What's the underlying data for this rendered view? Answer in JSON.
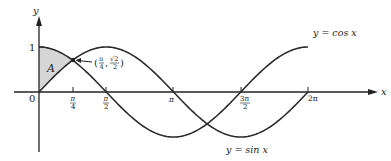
{
  "chart_data": {
    "type": "line",
    "title": "",
    "xlabel": "x",
    "ylabel": "y",
    "xlim": [
      0,
      6.2832
    ],
    "ylim": [
      -1,
      1
    ],
    "grid": false,
    "legend": "inline labels",
    "x_ticks": [
      "π/4",
      "π/2",
      "π",
      "3π/2",
      "2π"
    ],
    "x_tick_values": [
      0.7854,
      1.5708,
      3.1416,
      4.7124,
      6.2832
    ],
    "y_ticks": [
      "1"
    ],
    "origin_label": "0",
    "series": [
      {
        "name": "y = cos x",
        "function": "cos",
        "x_range": [
          0,
          6.2832
        ]
      },
      {
        "name": "y = sin x",
        "function": "sin",
        "x_range": [
          0,
          6.2832
        ]
      }
    ],
    "shaded_region": {
      "label": "A",
      "description": "Region between y = cos x (top) and y = sin x (bottom) for 0 ≤ x ≤ π/4",
      "x_range": [
        0,
        0.7854
      ],
      "color": "#d6d6d6"
    },
    "annotations": [
      {
        "text": "(π/4, √2/2)",
        "point": [
          0.7854,
          0.7071
        ],
        "arrow": true
      }
    ]
  },
  "labels": {
    "y_axis": "y",
    "x_axis": "x",
    "one": "1",
    "origin": "0",
    "region": "A",
    "cos_label": "y = cos x",
    "sin_label": "y = sin x",
    "point_label_open": "(",
    "point_label_close": ")",
    "pi_over_4_num": "π",
    "pi_over_4_den": "4",
    "sqrt2_num": "√2",
    "sqrt2_den": "2",
    "tick_pi4_num": "π",
    "tick_pi4_den": "4",
    "tick_pi2_num": "π",
    "tick_pi2_den": "2",
    "tick_pi": "π",
    "tick_3pi2_num": "3π",
    "tick_3pi2_den": "2",
    "tick_2pi": "2π"
  }
}
